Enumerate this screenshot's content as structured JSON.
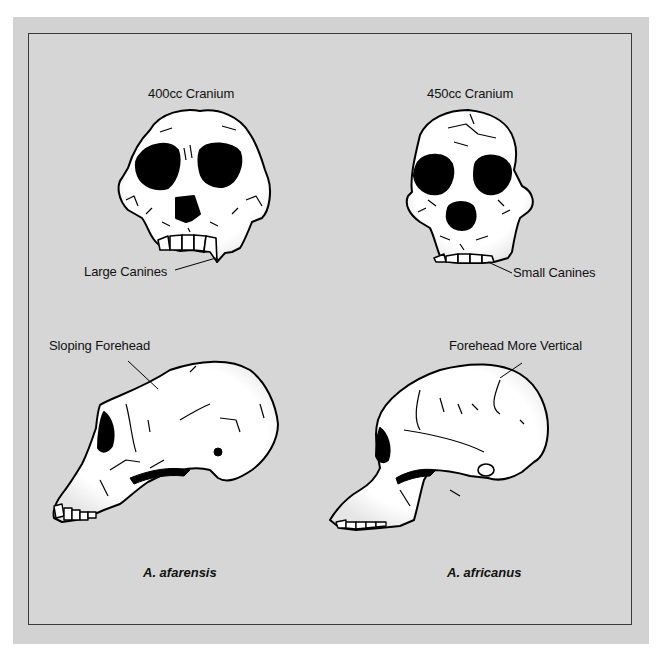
{
  "figure": {
    "type": "comparative-anatomy-diagram",
    "columns": [
      {
        "species": "A. afarensis",
        "front_view": {
          "caption": "400cc Cranium",
          "callout": "Large Canines"
        },
        "side_view": {
          "callout": "Sloping Forehead"
        }
      },
      {
        "species": "A. africanus",
        "front_view": {
          "caption": "450cc Cranium",
          "callout": "Small Canines"
        },
        "side_view": {
          "callout": "Forehead More Vertical"
        }
      }
    ]
  },
  "colors": {
    "panel_background": "#d6d6d6",
    "outer_background": "#d2d2d2",
    "frame_border": "#3a3a3a",
    "bone_fill": "#ffffff",
    "ink": "#000000"
  }
}
